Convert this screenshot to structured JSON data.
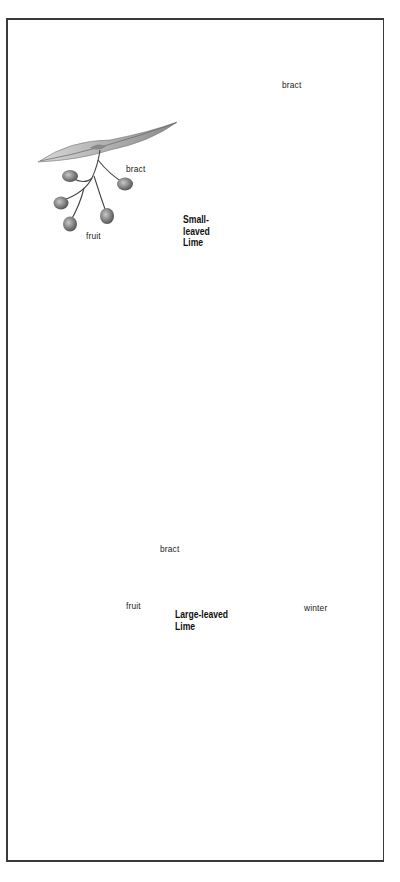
{
  "plate": {
    "subject": "Lime trees (botanical illustration plate)",
    "colors": {
      "border": "#3a3a3a",
      "ink": "#222222",
      "leaf_dark": "#4a4a4a",
      "leaf_mid": "#7a7a7a",
      "leaf_light": "#b8b8b8"
    }
  },
  "small_leaved": {
    "title_lines": [
      "Small-",
      "leaved",
      "Lime"
    ],
    "labels": {
      "fruit_bract": "bract",
      "fruit": "fruit",
      "flower_bract": "bract"
    },
    "illustrations": [
      "fruiting-spray",
      "flowering-spray",
      "summer-tree"
    ]
  },
  "large_leaved": {
    "title_lines": [
      "Large-leaved",
      "Lime"
    ],
    "labels": {
      "bract": "bract",
      "fruit": "fruit",
      "winter": "winter"
    },
    "illustrations": [
      "fruiting-spray",
      "winter-tree",
      "leaf-and-flower-spray"
    ]
  }
}
